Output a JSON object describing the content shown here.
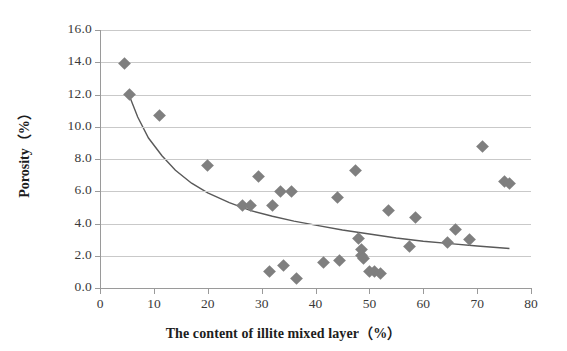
{
  "chart_data": {
    "type": "scatter",
    "title": "",
    "xlabel": "The content of illite mixed layer（%）",
    "ylabel": "Porosity（%）",
    "xlim": [
      0,
      80
    ],
    "ylim": [
      0.0,
      16.0
    ],
    "xticks": [
      "0",
      "10",
      "20",
      "30",
      "40",
      "50",
      "60",
      "70",
      "80"
    ],
    "yticks": [
      "0.0",
      "2.0",
      "4.0",
      "6.0",
      "8.0",
      "10.0",
      "12.0",
      "14.0",
      "16.0"
    ],
    "grid": "horizontal",
    "legend": "none",
    "marker": {
      "shape": "diamond",
      "color": "#7f7f7f",
      "size": 9
    },
    "series": [
      {
        "name": "Porosity vs illite mixed layer content",
        "points": [
          [
            4.5,
            13.9
          ],
          [
            5.5,
            12.0
          ],
          [
            11.0,
            10.7
          ],
          [
            20.0,
            7.6
          ],
          [
            26.5,
            5.1
          ],
          [
            28.0,
            5.1
          ],
          [
            29.5,
            6.9
          ],
          [
            31.5,
            1.0
          ],
          [
            32.0,
            5.1
          ],
          [
            33.5,
            6.0
          ],
          [
            34.0,
            1.4
          ],
          [
            35.5,
            6.0
          ],
          [
            36.5,
            0.6
          ],
          [
            41.5,
            1.6
          ],
          [
            44.0,
            5.6
          ],
          [
            44.5,
            1.7
          ],
          [
            47.5,
            7.3
          ],
          [
            48.0,
            3.1
          ],
          [
            48.5,
            2.4
          ],
          [
            48.5,
            2.0
          ],
          [
            49.0,
            1.8
          ],
          [
            50.0,
            1.0
          ],
          [
            51.0,
            1.0
          ],
          [
            52.0,
            0.9
          ],
          [
            53.5,
            4.8
          ],
          [
            57.5,
            2.6
          ],
          [
            58.5,
            4.4
          ],
          [
            64.5,
            2.8
          ],
          [
            66.0,
            3.6
          ],
          [
            68.5,
            3.0
          ],
          [
            71.0,
            8.8
          ],
          [
            75.0,
            6.6
          ],
          [
            76.0,
            6.5
          ]
        ]
      }
    ],
    "trend": {
      "type": "power-decay-curve",
      "color": "#595959",
      "points": [
        [
          5.3,
          12.05
        ],
        [
          7.0,
          10.6
        ],
        [
          9.0,
          9.3
        ],
        [
          11.5,
          8.2
        ],
        [
          14.0,
          7.3
        ],
        [
          17.0,
          6.5
        ],
        [
          20.0,
          5.9
        ],
        [
          24.0,
          5.3
        ],
        [
          28.0,
          4.8
        ],
        [
          32.0,
          4.45
        ],
        [
          36.0,
          4.15
        ],
        [
          40.0,
          3.9
        ],
        [
          45.0,
          3.6
        ],
        [
          50.0,
          3.35
        ],
        [
          55.0,
          3.1
        ],
        [
          60.0,
          2.9
        ],
        [
          65.0,
          2.75
        ],
        [
          70.0,
          2.6
        ],
        [
          76.0,
          2.45
        ]
      ]
    }
  }
}
